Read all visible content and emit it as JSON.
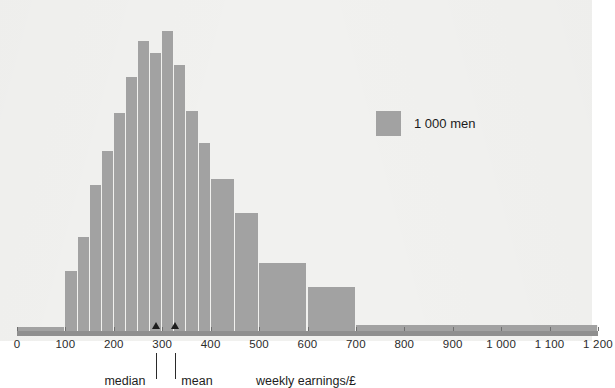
{
  "chart_data": {
    "type": "bar",
    "title": "",
    "subtitle": "",
    "xlabel": "weekly earnings/£",
    "ylabel": "",
    "xlim": [
      0,
      1200
    ],
    "ylim": [
      0,
      0.0062
    ],
    "grid": false,
    "legend_position": "inside-right",
    "bar_color": "#a2a2a2",
    "background_color": "#f1f1ef",
    "axis_color": "#8f8f8f",
    "note": "Histogram of weekly earnings of a sample of 1000 men. Unequal bin widths: one wide 0-100 bin, 25-wide bins from 100 to 400, 50-wide bins from 400 to 500, 100-wide bins from 500 to 1200. Bar heights below are drawn heights in pixels above the axis as read from the figure.",
    "x_ticks": [
      0,
      100,
      200,
      300,
      400,
      500,
      600,
      700,
      800,
      900,
      1000,
      1100,
      1200
    ],
    "x_tick_labels": [
      "0",
      "100",
      "200",
      "300",
      "400",
      "500",
      "600",
      "700",
      "800",
      "900",
      "1 000",
      "1 100",
      "1 200"
    ],
    "bins": [
      {
        "start": 0,
        "end": 100,
        "height": 4
      },
      {
        "start": 100,
        "end": 125,
        "height": 60
      },
      {
        "start": 125,
        "end": 150,
        "height": 94
      },
      {
        "start": 150,
        "end": 175,
        "height": 146
      },
      {
        "start": 175,
        "end": 200,
        "height": 180
      },
      {
        "start": 200,
        "end": 225,
        "height": 218
      },
      {
        "start": 225,
        "end": 250,
        "height": 254
      },
      {
        "start": 250,
        "end": 275,
        "height": 290
      },
      {
        "start": 275,
        "end": 300,
        "height": 278
      },
      {
        "start": 300,
        "end": 325,
        "height": 300
      },
      {
        "start": 325,
        "end": 350,
        "height": 266
      },
      {
        "start": 350,
        "end": 375,
        "height": 220
      },
      {
        "start": 375,
        "end": 400,
        "height": 188
      },
      {
        "start": 400,
        "end": 450,
        "height": 152
      },
      {
        "start": 450,
        "end": 500,
        "height": 118
      },
      {
        "start": 500,
        "end": 600,
        "height": 68
      },
      {
        "start": 600,
        "end": 700,
        "height": 44
      },
      {
        "start": 700,
        "end": 1200,
        "height": 6
      }
    ],
    "annotations": [
      {
        "name": "median",
        "label": "median",
        "value": 288
      },
      {
        "name": "mean",
        "label": "mean",
        "value": 327
      }
    ],
    "legend": [
      {
        "label": "1 000 men",
        "color": "#a2a2a2"
      }
    ]
  }
}
